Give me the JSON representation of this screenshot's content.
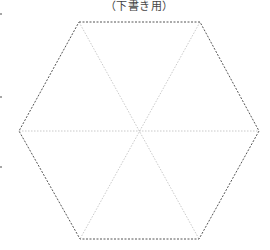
{
  "title": "（下書き用）",
  "diagram": {
    "shape": "regular hexagon, dashed outline, with three dotted diagonals through center",
    "center": [
      139,
      131
    ],
    "vertices": [
      [
        79,
        22
      ],
      [
        200,
        22
      ],
      [
        259,
        131
      ],
      [
        199,
        239
      ],
      [
        80,
        239
      ],
      [
        19,
        131
      ]
    ],
    "outline_color": "#555555",
    "diagonal_color": "#bbbbbb"
  },
  "margin_marks": [
    [
      1,
      14
    ],
    [
      1,
      97
    ],
    [
      1,
      167
    ]
  ]
}
